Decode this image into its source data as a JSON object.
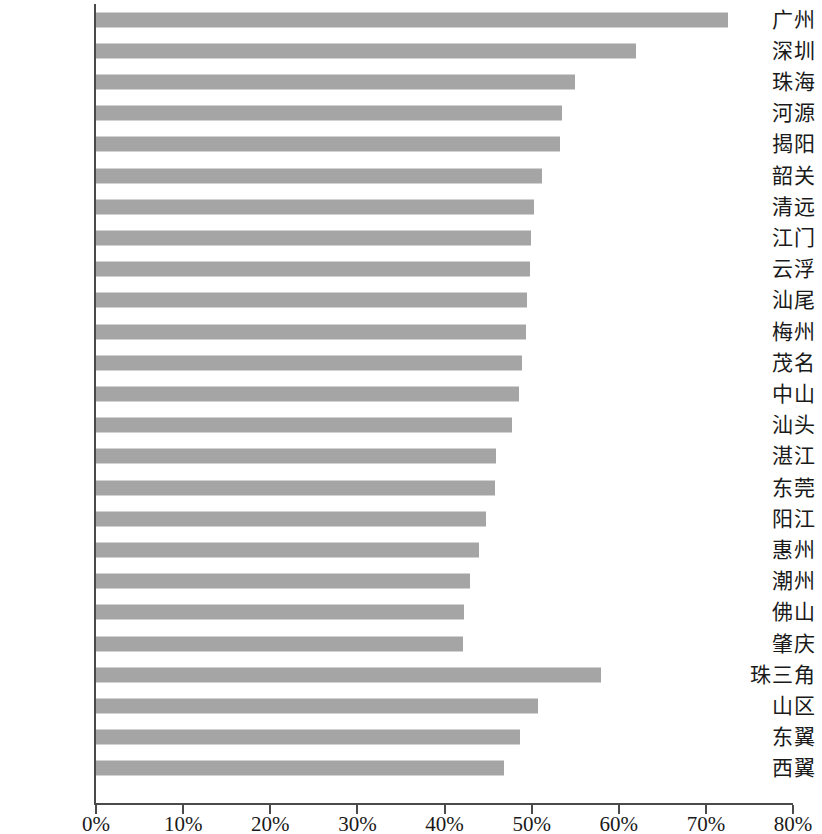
{
  "chart_data": {
    "type": "bar",
    "orientation": "horizontal",
    "title": "",
    "subtitle": "",
    "xlabel": "",
    "ylabel": "",
    "xlim": [
      0,
      80
    ],
    "xunit": "%",
    "grid": false,
    "legend": null,
    "bar_color": "#a5a5a5",
    "axis_color": "#4a4a4a",
    "background": "#ffffff",
    "xticks": [
      0,
      10,
      20,
      30,
      40,
      50,
      60,
      70,
      80
    ],
    "xticklabels": [
      "0%",
      "10%",
      "20%",
      "30%",
      "40%",
      "50%",
      "60%",
      "70%",
      "80%"
    ],
    "categories": [
      "广州",
      "深圳",
      "珠海",
      "河源",
      "揭阳",
      "韶关",
      "清远",
      "江门",
      "云浮",
      "汕尾",
      "梅州",
      "茂名",
      "中山",
      "汕头",
      "湛江",
      "东莞",
      "阳江",
      "惠州",
      "潮州",
      "佛山",
      "肇庆",
      "珠三角",
      "山区",
      "东翼",
      "西翼"
    ],
    "values": [
      72.5,
      62.0,
      55.0,
      53.5,
      53.3,
      51.2,
      50.3,
      49.9,
      49.8,
      49.5,
      49.3,
      48.9,
      48.5,
      47.8,
      45.9,
      45.8,
      44.8,
      44.0,
      42.9,
      42.2,
      42.1,
      58.0,
      50.7,
      48.7,
      46.8
    ]
  }
}
